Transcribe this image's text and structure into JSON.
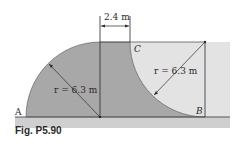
{
  "figure": {
    "caption": "Fig. P5.90",
    "dimension_label": "2.4 m",
    "radius_left_label": "r = 6.3 m",
    "radius_right_label": "r = 6.3 m",
    "points": {
      "A": "A",
      "B": "B",
      "C": "C"
    },
    "colors": {
      "dark_region": "#a9a9a9",
      "light_region": "#e2e2e2",
      "ground": "#c8c8c8",
      "lines": "#2a2a2a"
    }
  }
}
